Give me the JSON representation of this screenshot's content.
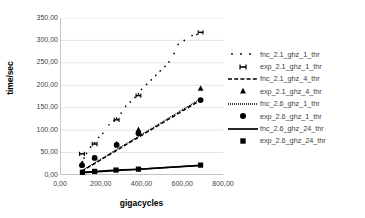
{
  "chart_data": {
    "type": "scatter",
    "title": "",
    "xlabel": "gigacycles",
    "ylabel": "time/sec",
    "xlim": [
      0,
      800
    ],
    "ylim": [
      0,
      350
    ],
    "grid": true,
    "grid_axis": "y",
    "legend_position": "right",
    "decimal_separator": ",",
    "xticks": [
      "0,00",
      "200,00",
      "400,00",
      "600,00",
      "800,00"
    ],
    "xtick_values": [
      0,
      200,
      400,
      600,
      800
    ],
    "yticks": [
      "0,00",
      "50,00",
      "100,00",
      "150,00",
      "200,00",
      "250,00",
      "300,00",
      "350,00"
    ],
    "ytick_values": [
      0,
      50,
      100,
      150,
      200,
      250,
      300,
      350
    ],
    "series": [
      {
        "name": "fnc_2.1_ghz_1_thr",
        "style": "dotted-markers",
        "marker": "small-dot",
        "line": "none",
        "color": "#000000",
        "points": [
          [
            105,
            22.0
          ],
          [
            110,
            30.0
          ],
          [
            118,
            38.0
          ],
          [
            130,
            48.0
          ],
          [
            150,
            62.0
          ],
          [
            170,
            72.0
          ],
          [
            190,
            84.0
          ],
          [
            210,
            93.0
          ],
          [
            240,
            112.0
          ],
          [
            265,
            121.0
          ],
          [
            278,
            127.0
          ],
          [
            300,
            138.0
          ],
          [
            322,
            153.0
          ],
          [
            345,
            163.0
          ],
          [
            368,
            173.0
          ],
          [
            385,
            181.0
          ],
          [
            400,
            191.0
          ],
          [
            425,
            202.0
          ],
          [
            448,
            212.0
          ],
          [
            470,
            222.0
          ],
          [
            492,
            232.0
          ],
          [
            515,
            242.0
          ],
          [
            535,
            252.0
          ],
          [
            560,
            271.0
          ],
          [
            580,
            291.0
          ],
          [
            610,
            300.0
          ],
          [
            648,
            311.0
          ],
          [
            672,
            313.0
          ]
        ]
      },
      {
        "name": "exp_2.1_ghz_1_thr",
        "style": "markers",
        "marker": "H",
        "line": "none",
        "color": "#000000",
        "points": [
          [
            108,
            47.0
          ],
          [
            170,
            69.0
          ],
          [
            278,
            123.0
          ],
          [
            385,
            177.0
          ],
          [
            690,
            318.0
          ]
        ]
      },
      {
        "name": "fnc_2.1_ghz_4_thr",
        "style": "dashed-line",
        "marker": "none",
        "line": "dashed",
        "color": "#000000",
        "points": [
          [
            105,
            8.0
          ],
          [
            690,
            167.0
          ]
        ]
      },
      {
        "name": "exp_2.1_ghz_4_thr",
        "style": "markers",
        "marker": "triangle",
        "line": "none",
        "color": "#000000",
        "points": [
          [
            108,
            24.0
          ],
          [
            170,
            39.0
          ],
          [
            278,
            69.0
          ],
          [
            385,
            101.0
          ],
          [
            690,
            193.0
          ]
        ]
      },
      {
        "name": "fnc_2.6_ghz_1_thr",
        "style": "fine-dotted-line",
        "marker": "none",
        "line": "fine-dotted",
        "color": "#000000",
        "points": [
          [
            105,
            9.0
          ],
          [
            690,
            170.0
          ]
        ]
      },
      {
        "name": "exp_2.6_ghz_1_thr",
        "style": "markers",
        "marker": "circle",
        "line": "none",
        "color": "#000000",
        "points": [
          [
            108,
            22.0
          ],
          [
            170,
            38.0
          ],
          [
            278,
            67.0
          ],
          [
            385,
            93.0
          ],
          [
            690,
            167.0
          ]
        ]
      },
      {
        "name": "fnc_2.6_ghz_24_thr",
        "style": "solid-line",
        "marker": "none",
        "line": "solid",
        "color": "#000000",
        "points": [
          [
            105,
            5.0
          ],
          [
            690,
            21.0
          ]
        ]
      },
      {
        "name": "exp_2.6_ghz_24_thr",
        "style": "markers",
        "marker": "square",
        "line": "solid",
        "color": "#000000",
        "points": [
          [
            110,
            6.0
          ],
          [
            170,
            8.0
          ],
          [
            275,
            11.0
          ],
          [
            385,
            13.0
          ],
          [
            690,
            22.0
          ]
        ]
      }
    ],
    "legend": [
      {
        "label": "fnc_2.1_ghz_1_thr",
        "key": "dots"
      },
      {
        "label": "exp_2.1_ghz_1_thr",
        "key": "H"
      },
      {
        "label": "fnc_2.1_ghz_4_thr",
        "key": "dashed"
      },
      {
        "label": "exp_2.1_ghz_4_thr",
        "key": "triangle"
      },
      {
        "label": "fnc_2.6_ghz_1_thr",
        "key": "fine-dotted"
      },
      {
        "label": "exp_2.6_ghz_1_thr",
        "key": "circle"
      },
      {
        "label": "fnc_2.6_ghz_24_thr",
        "key": "solid"
      },
      {
        "label": "exp_2.6_ghz_24_thr",
        "key": "square"
      }
    ]
  }
}
